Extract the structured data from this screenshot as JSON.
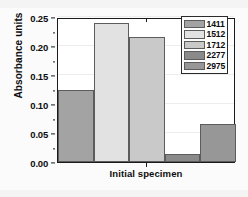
{
  "chart_data": {
    "type": "bar",
    "title": "",
    "subtitle": "",
    "xlabel": "Initial specimen",
    "ylabel": "Absorbance units",
    "categories": [
      "1411",
      "1512",
      "1712",
      "2277",
      "2975"
    ],
    "values": [
      0.125,
      0.24,
      0.215,
      0.013,
      0.066
    ],
    "series": [
      {
        "name": "Initial specimen",
        "values": [
          0.125,
          0.24,
          0.215,
          0.013,
          0.066
        ]
      }
    ],
    "ylim": [
      0.0,
      0.25
    ],
    "ytick_labels": [
      "0.00",
      "0.05",
      "0.10",
      "0.15",
      "0.20",
      "0.25"
    ],
    "ytick_values": [
      0.0,
      0.05,
      0.1,
      0.15,
      0.2,
      0.25
    ],
    "xtick_labels": [
      "Initial specimen"
    ],
    "grid": true,
    "legend_position": "top-right",
    "legend_entries": [
      {
        "label": "1411",
        "color": "#a3a3a3"
      },
      {
        "label": "1512",
        "color": "#e2e2e2"
      },
      {
        "label": "1712",
        "color": "#c9c9c9"
      },
      {
        "label": "2277",
        "color": "#8a8a8a"
      },
      {
        "label": "2975",
        "color": "#979797"
      }
    ],
    "bar_colors": [
      "#a3a3a3",
      "#e2e2e2",
      "#c9c9c9",
      "#8a8a8a",
      "#979797"
    ],
    "axis_color": "#1a1a1a",
    "plot_background": "#ffffff",
    "figure_background": "#f4f4f4"
  }
}
